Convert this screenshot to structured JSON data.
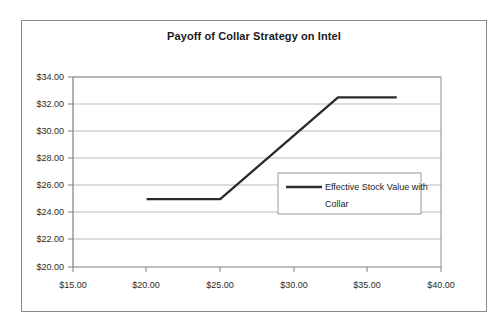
{
  "chart_data": {
    "type": "line",
    "title": "Payoff of Collar Strategy on Intel",
    "xlabel": "",
    "ylabel": "",
    "xlim": [
      15,
      40
    ],
    "ylim": [
      20,
      34
    ],
    "grid": "horizontal",
    "legend_position": "center-right",
    "x_ticks": [
      "$15.00",
      "$20.00",
      "$25.00",
      "$30.00",
      "$35.00",
      "$40.00"
    ],
    "x_tick_values": [
      15,
      20,
      25,
      30,
      35,
      40
    ],
    "y_ticks": [
      "$20.00",
      "$22.00",
      "$24.00",
      "$26.00",
      "$28.00",
      "$30.00",
      "$32.00",
      "$34.00"
    ],
    "y_tick_values": [
      20,
      22,
      24,
      26,
      28,
      30,
      32,
      34
    ],
    "series": [
      {
        "name": "Effective Stock Value with Collar",
        "legend_line_1": "Effective Stock Value with",
        "legend_line_2": "Collar",
        "color": "#2b2b2b",
        "x": [
          20,
          25,
          33,
          37
        ],
        "y": [
          25,
          25,
          32.5,
          32.5
        ]
      }
    ]
  },
  "legend": {
    "entry_label": "Effective Stock Value with Collar"
  },
  "colors": {
    "line": "#2b2b2b",
    "grid": "#b9b9b9",
    "axis": "#7f7f7f",
    "frame": "#8a8a8a",
    "text": "#1a1a1a",
    "background": "#ffffff"
  }
}
